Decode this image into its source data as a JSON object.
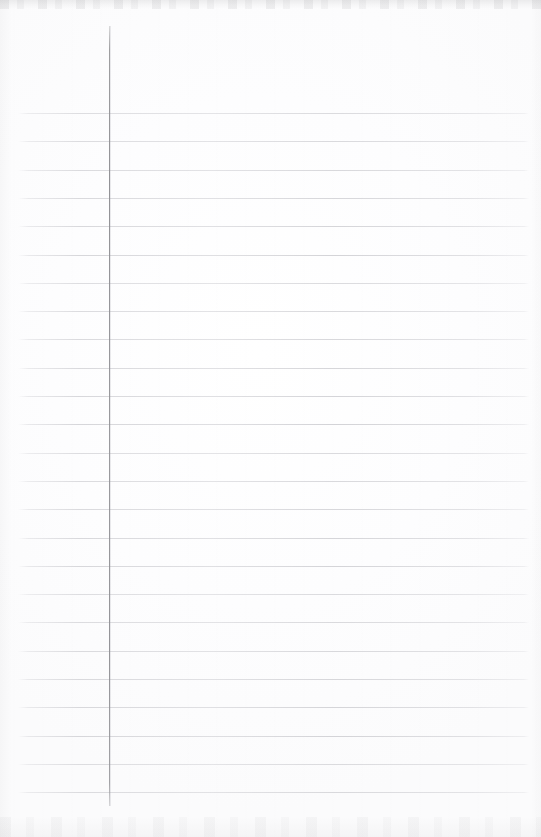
{
  "document": {
    "kind": "scanned-ruled-notebook-page",
    "title": "Blank ruled notebook page",
    "orientation": "portrait",
    "page_width": 541,
    "page_height": 837,
    "paper_color": "#fdfdfd",
    "is_blank": true,
    "handwriting_text": "",
    "printed_text": ""
  },
  "ruling": {
    "style": "single-margin college ruled",
    "line_color": "#e2e2e4",
    "line_thickness_px": 1,
    "line_count": 25,
    "first_line_y": 113,
    "line_spacing_px": 28.3,
    "line_start_x": 18,
    "line_end_x": 529,
    "lines_y": [
      113,
      141.3,
      169.6,
      197.9,
      226.2,
      254.5,
      282.8,
      311.1,
      339.4,
      367.7,
      396.0,
      424.3,
      452.6,
      480.9,
      509.2,
      537.5,
      565.8,
      594.1,
      622.4,
      650.7,
      679.0,
      707.3,
      735.6,
      763.9,
      792.2
    ]
  },
  "margin_rule": {
    "label": "vertical margin rule",
    "color": "#9a9a9a",
    "x": 109,
    "top_y": 26,
    "bottom_y": 806,
    "thickness_px": 1
  },
  "scan_artifacts": {
    "top_edge_band": "faint gray speckle band",
    "bottom_edge_band": "faint gray speckle band",
    "left_edge_shadow": "faint",
    "right_edge_shadow": "faint"
  }
}
